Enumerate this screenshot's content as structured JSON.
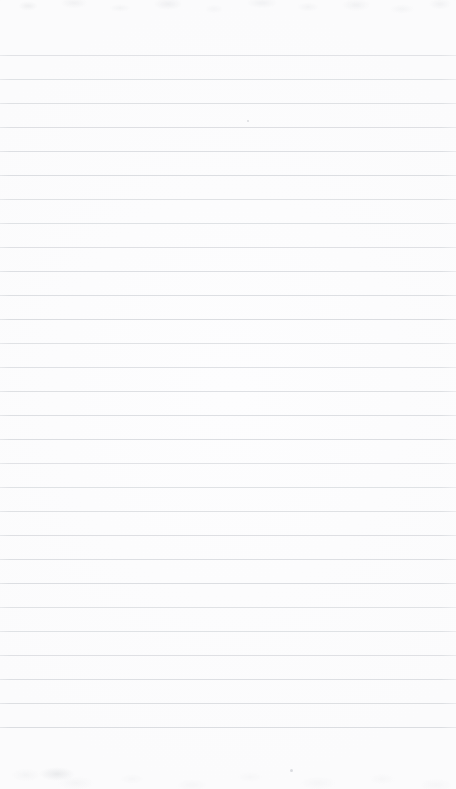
{
  "document": {
    "kind": "scanned-lined-notebook-page",
    "description": "Blank ruled notepad page scan",
    "page_width": 456,
    "page_height": 789,
    "text_content": "",
    "handwriting": "",
    "printed_text": ""
  },
  "paper": {
    "background_color": "#fefefe",
    "base_tone_color": "#fdfdfd",
    "edge_tone_color": "#fafafa"
  },
  "ruling": {
    "line_color": "#cfd2d6",
    "line_thickness_px": 1,
    "line_spacing_px": 24,
    "first_line_y": 55,
    "last_line_y": 727,
    "line_count": 29,
    "left_margin_x": 0,
    "right_margin_x": 456,
    "has_vertical_margin_rule": false,
    "line_positions": [
      55,
      79,
      103,
      127,
      151,
      175,
      199,
      223,
      247,
      271,
      295,
      319,
      343,
      367,
      391,
      415,
      439,
      463,
      487,
      511,
      535,
      559,
      583,
      607,
      631,
      655,
      679,
      703,
      727
    ]
  },
  "margins": {
    "top_blank_height": 55,
    "bottom_blank_height": 62
  },
  "artifacts": {
    "top_noise_color": "#b7babe",
    "bottom_noise_color": "#b8bbbf",
    "smudge_color": "#acb0b6",
    "specks": [
      {
        "x": 290,
        "y": 769,
        "size": 3
      },
      {
        "x": 247,
        "y": 120,
        "size": 2
      }
    ]
  }
}
